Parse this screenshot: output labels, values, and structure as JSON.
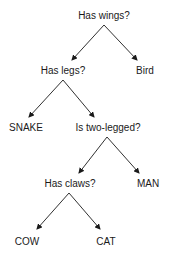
{
  "diagram": {
    "type": "decision-tree",
    "colors": {
      "line": "#1a1a1a",
      "text": "#1a1a1a",
      "background": "#ffffff"
    },
    "nodes": [
      {
        "id": "has_wings",
        "label": "Has wings?",
        "kind": "question",
        "x": 104,
        "y": 16
      },
      {
        "id": "has_legs",
        "label": "Has legs?",
        "kind": "question",
        "x": 63,
        "y": 71
      },
      {
        "id": "bird",
        "label": "Bird",
        "kind": "leaf",
        "x": 145,
        "y": 71
      },
      {
        "id": "snake",
        "label": "SNAKE",
        "kind": "leaf",
        "x": 26,
        "y": 128
      },
      {
        "id": "is_two_legged",
        "label": "Is two-legged?",
        "kind": "question",
        "x": 108,
        "y": 128
      },
      {
        "id": "has_claws",
        "label": "Has claws?",
        "kind": "question",
        "x": 70,
        "y": 184
      },
      {
        "id": "man",
        "label": "MAN",
        "kind": "leaf",
        "x": 148,
        "y": 184
      },
      {
        "id": "cow",
        "label": "COW",
        "kind": "leaf",
        "x": 27,
        "y": 242
      },
      {
        "id": "cat",
        "label": "CAT",
        "kind": "leaf",
        "x": 106,
        "y": 242
      }
    ],
    "edges": [
      {
        "from": "has_wings",
        "to": "has_legs",
        "x1": 104,
        "y1": 25,
        "x2": 72,
        "y2": 60
      },
      {
        "from": "has_wings",
        "to": "bird",
        "x1": 104,
        "y1": 25,
        "x2": 137,
        "y2": 60
      },
      {
        "from": "has_legs",
        "to": "snake",
        "x1": 63,
        "y1": 80,
        "x2": 29,
        "y2": 117
      },
      {
        "from": "has_legs",
        "to": "is_two_legged",
        "x1": 63,
        "y1": 80,
        "x2": 94,
        "y2": 117
      },
      {
        "from": "is_two_legged",
        "to": "has_claws",
        "x1": 107,
        "y1": 137,
        "x2": 79,
        "y2": 173
      },
      {
        "from": "is_two_legged",
        "to": "man",
        "x1": 107,
        "y1": 137,
        "x2": 139,
        "y2": 173
      },
      {
        "from": "has_claws",
        "to": "cow",
        "x1": 69,
        "y1": 193,
        "x2": 37,
        "y2": 229
      },
      {
        "from": "has_claws",
        "to": "cat",
        "x1": 69,
        "y1": 193,
        "x2": 100,
        "y2": 229
      }
    ]
  }
}
